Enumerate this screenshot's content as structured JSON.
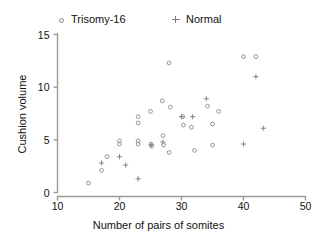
{
  "chart_data": {
    "type": "scatter",
    "title": "",
    "xlabel": "Number of pairs of somites",
    "ylabel": "Cushion volume",
    "xlim": [
      10,
      50
    ],
    "ylim": [
      0,
      15
    ],
    "xticks": [
      10,
      20,
      30,
      40,
      50
    ],
    "yticks": [
      0,
      5,
      10,
      15
    ],
    "grid": false,
    "legend_position": "top",
    "series": [
      {
        "name": "Trisomy-16",
        "marker": "open-circle",
        "color": "#8a8a8a",
        "points": [
          [
            15.0,
            0.9
          ],
          [
            17.1,
            2.1
          ],
          [
            18.0,
            3.4
          ],
          [
            20.0,
            4.9
          ],
          [
            20.0,
            4.6
          ],
          [
            23.0,
            7.2
          ],
          [
            23.0,
            6.6
          ],
          [
            23.0,
            4.9
          ],
          [
            23.0,
            4.6
          ],
          [
            25.0,
            7.7
          ],
          [
            25.1,
            4.6
          ],
          [
            25.2,
            4.4
          ],
          [
            26.9,
            8.7
          ],
          [
            27.0,
            5.4
          ],
          [
            27.1,
            4.5
          ],
          [
            28.0,
            12.3
          ],
          [
            28.2,
            8.1
          ],
          [
            28.0,
            3.8
          ],
          [
            30.2,
            7.2
          ],
          [
            30.3,
            6.4
          ],
          [
            31.6,
            6.2
          ],
          [
            32.1,
            4.0
          ],
          [
            34.2,
            8.2
          ],
          [
            35.0,
            6.5
          ],
          [
            35.0,
            4.5
          ],
          [
            36.0,
            7.7
          ],
          [
            40.0,
            12.9
          ],
          [
            42.0,
            12.9
          ]
        ]
      },
      {
        "name": "Normal",
        "marker": "plus",
        "color": "#7a7a7a",
        "points": [
          [
            17.1,
            2.8
          ],
          [
            20.0,
            3.4
          ],
          [
            21.0,
            2.6
          ],
          [
            23.0,
            1.3
          ],
          [
            25.1,
            4.5
          ],
          [
            27.0,
            4.8
          ],
          [
            30.0,
            7.2
          ],
          [
            31.8,
            7.2
          ],
          [
            34.0,
            8.9
          ],
          [
            40.0,
            4.6
          ],
          [
            42.0,
            11.0
          ],
          [
            43.2,
            6.1
          ]
        ]
      }
    ]
  },
  "legend": {
    "trisomy_label": "Trisomy-16",
    "normal_label": "Normal"
  },
  "axes": {
    "x_title": "Number of pairs of somites",
    "y_title": "Cushion volume",
    "x_tick_labels": [
      "10",
      "20",
      "30",
      "40",
      "50"
    ],
    "y_tick_labels": [
      "0",
      "5",
      "10",
      "15"
    ]
  },
  "colors": {
    "axis": "#9a9a9a",
    "trisomy_marker": "#8a8a8a",
    "normal_marker": "#7a7a7a",
    "text": "#111111",
    "background": "#ffffff"
  }
}
